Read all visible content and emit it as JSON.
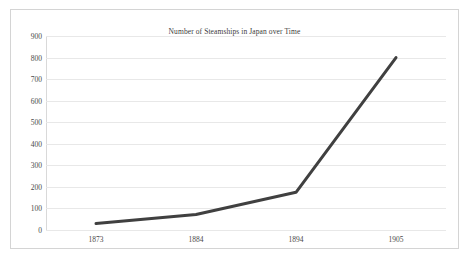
{
  "chart_data": {
    "type": "line",
    "title": "Number of Steamships in Japan over Time",
    "xlabel": "",
    "ylabel": "",
    "categories": [
      "1873",
      "1884",
      "1894",
      "1905"
    ],
    "x": [
      1873,
      1884,
      1894,
      1905
    ],
    "values": [
      30,
      72,
      175,
      800
    ],
    "series": [
      {
        "name": "Number of Steamships",
        "values": [
          30,
          72,
          175,
          800
        ]
      }
    ],
    "ylim": [
      0,
      900
    ],
    "y_ticks": [
      0,
      100,
      200,
      300,
      400,
      500,
      600,
      700,
      800,
      900
    ],
    "y_tick_labels": [
      "0",
      "100",
      "200",
      "300",
      "400",
      "500",
      "600",
      "700",
      "800",
      "900"
    ],
    "grid": "horizontal",
    "legend": "none",
    "line_color": "#404040",
    "gridline_color": "#e8e8e8",
    "axis_color": "#d9d9d9",
    "text_color": "#4a4a4a",
    "background_color": "#ffffff",
    "border_color": "#d4d4d4"
  }
}
